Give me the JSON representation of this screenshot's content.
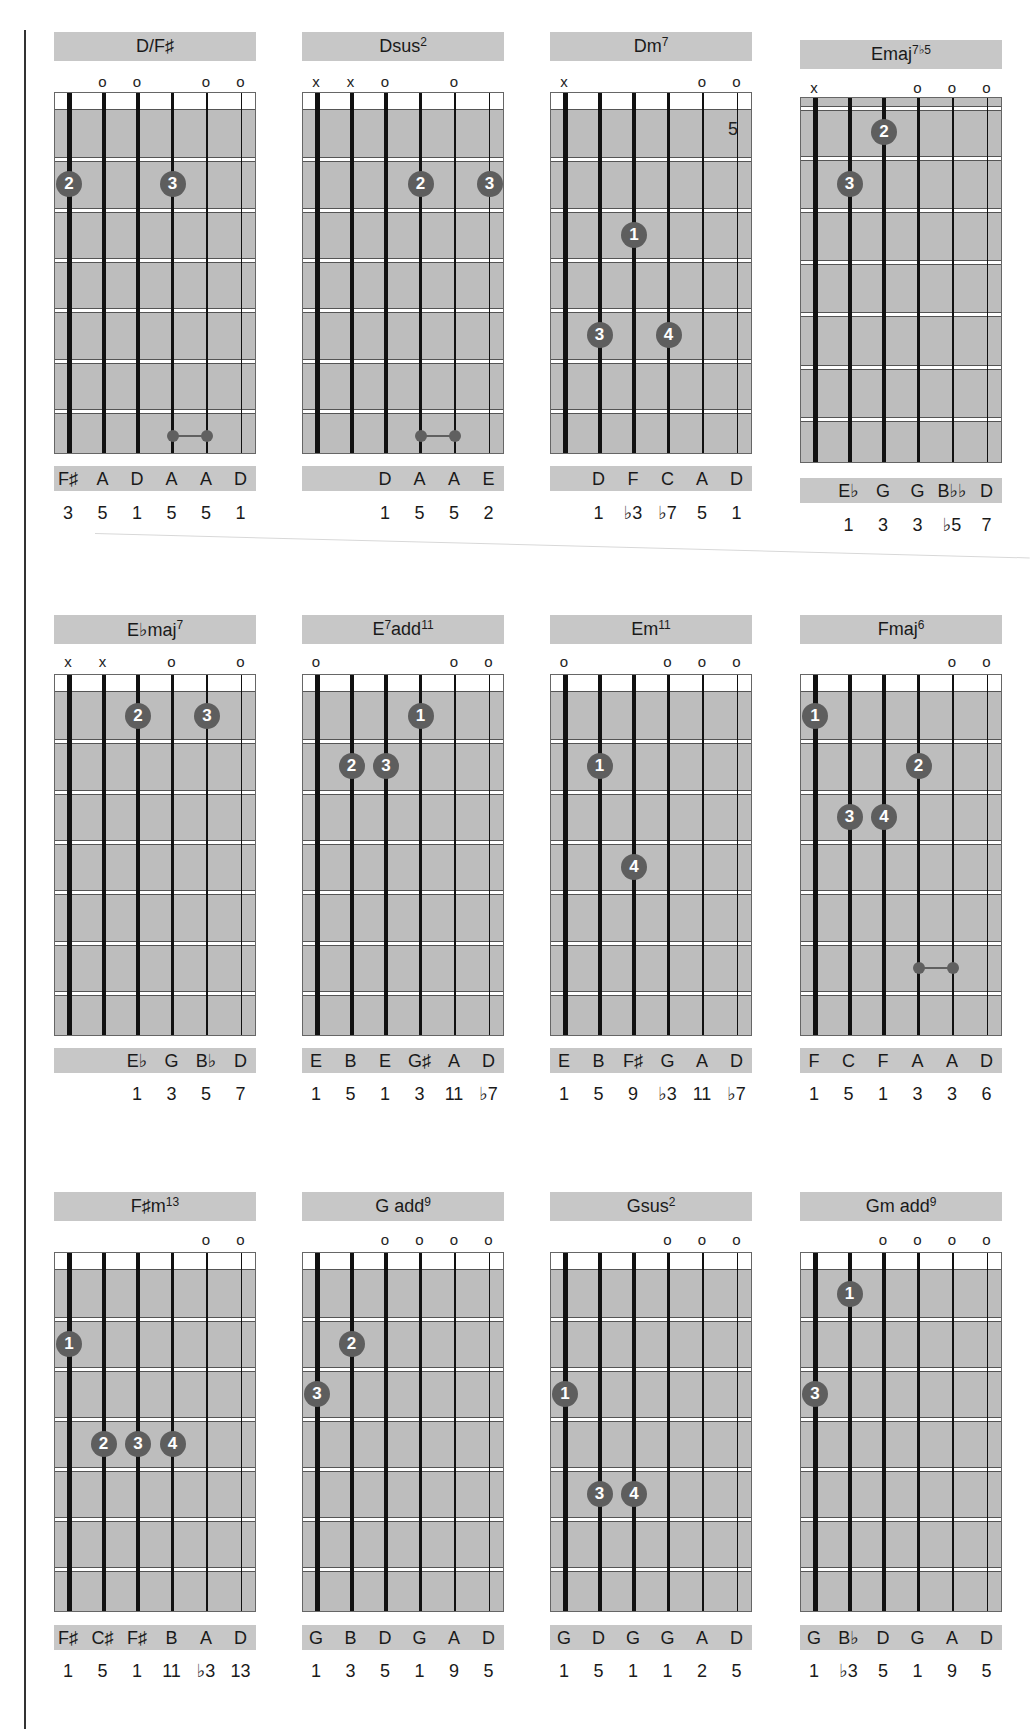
{
  "page": {
    "kind": "guitar chord chart"
  },
  "rows": [
    {
      "chords": [
        {
          "name": "D/F♯",
          "sup": "",
          "markers": [
            "",
            "o",
            "o",
            "",
            "o",
            "o"
          ],
          "position_label": "",
          "fingers": [
            {
              "finger": "2",
              "string": 0,
              "fret": 2
            },
            {
              "finger": "3",
              "string": 3,
              "fret": 2
            }
          ],
          "barre": {
            "from_string": 3,
            "to_string": 4,
            "fret": 7
          },
          "notes": [
            "F♯",
            "A",
            "D",
            "A",
            "A",
            "D"
          ],
          "intervals": [
            "3",
            "5",
            "1",
            "5",
            "5",
            "1"
          ]
        },
        {
          "name": "Dsus",
          "sup": "2",
          "markers": [
            "x",
            "x",
            "o",
            "",
            "o",
            ""
          ],
          "position_label": "",
          "fingers": [
            {
              "finger": "2",
              "string": 3,
              "fret": 2
            },
            {
              "finger": "3",
              "string": 5,
              "fret": 2
            }
          ],
          "barre": {
            "from_string": 3,
            "to_string": 4,
            "fret": 7
          },
          "notes": [
            "",
            "",
            "D",
            "A",
            "A",
            "E"
          ],
          "intervals": [
            "",
            "",
            "1",
            "5",
            "5",
            "2"
          ]
        },
        {
          "name": "Dm",
          "sup": "7",
          "markers": [
            "x",
            "",
            "",
            "",
            "o",
            "o"
          ],
          "position_label": "",
          "fingers": [
            {
              "finger": "1",
              "string": 2,
              "fret": 3
            },
            {
              "finger": "3",
              "string": 1,
              "fret": 5
            },
            {
              "finger": "4",
              "string": 3,
              "fret": 5
            }
          ],
          "barre": null,
          "notes": [
            "",
            "D",
            "F",
            "C",
            "A",
            "D"
          ],
          "intervals": [
            "",
            "1",
            "♭3",
            "♭7",
            "5",
            "1"
          ]
        },
        {
          "name": "Emaj",
          "sup": "7♭5",
          "markers": [
            "x",
            "",
            "",
            "o",
            "o",
            "o"
          ],
          "position_label": "5",
          "fingers": [
            {
              "finger": "2",
              "string": 2,
              "fret": 1
            },
            {
              "finger": "3",
              "string": 1,
              "fret": 2
            }
          ],
          "barre": null,
          "notes": [
            "",
            "E♭",
            "G",
            "G",
            "B♭♭",
            "D"
          ],
          "intervals": [
            "",
            "1",
            "3",
            "3",
            "♭5",
            "7"
          ]
        }
      ]
    },
    {
      "chords": [
        {
          "name": "E♭maj",
          "sup": "7",
          "markers": [
            "x",
            "x",
            "",
            "o",
            "",
            "o"
          ],
          "position_label": "",
          "fingers": [
            {
              "finger": "2",
              "string": 2,
              "fret": 1
            },
            {
              "finger": "3",
              "string": 4,
              "fret": 1
            }
          ],
          "barre": null,
          "notes": [
            "",
            "",
            "E♭",
            "G",
            "B♭",
            "D"
          ],
          "intervals": [
            "",
            "",
            "1",
            "3",
            "5",
            "7"
          ]
        },
        {
          "name": "E",
          "sup": "7",
          "suffix": "add",
          "sup2": "11",
          "markers": [
            "o",
            "",
            "",
            "",
            "o",
            "o"
          ],
          "position_label": "",
          "fingers": [
            {
              "finger": "1",
              "string": 3,
              "fret": 1
            },
            {
              "finger": "2",
              "string": 1,
              "fret": 2
            },
            {
              "finger": "3",
              "string": 2,
              "fret": 2
            }
          ],
          "barre": null,
          "notes": [
            "E",
            "B",
            "E",
            "G♯",
            "A",
            "D"
          ],
          "intervals": [
            "1",
            "5",
            "1",
            "3",
            "11",
            "♭7"
          ]
        },
        {
          "name": "Em",
          "sup": "11",
          "markers": [
            "o",
            "",
            "",
            "o",
            "o",
            "o"
          ],
          "position_label": "",
          "fingers": [
            {
              "finger": "1",
              "string": 1,
              "fret": 2
            },
            {
              "finger": "4",
              "string": 2,
              "fret": 4
            }
          ],
          "barre": null,
          "notes": [
            "E",
            "B",
            "F♯",
            "G",
            "A",
            "D"
          ],
          "intervals": [
            "1",
            "5",
            "9",
            "♭3",
            "11",
            "♭7"
          ]
        },
        {
          "name": "Fmaj",
          "sup": "6",
          "markers": [
            "",
            "",
            "",
            "",
            "o",
            "o"
          ],
          "position_label": "",
          "fingers": [
            {
              "finger": "1",
              "string": 0,
              "fret": 1
            },
            {
              "finger": "2",
              "string": 3,
              "fret": 2
            },
            {
              "finger": "3",
              "string": 1,
              "fret": 3
            },
            {
              "finger": "4",
              "string": 2,
              "fret": 3
            }
          ],
          "barre": {
            "from_string": 3,
            "to_string": 4,
            "fret": 6
          },
          "notes": [
            "F",
            "C",
            "F",
            "A",
            "A",
            "D"
          ],
          "intervals": [
            "1",
            "5",
            "1",
            "3",
            "3",
            "6"
          ]
        }
      ]
    },
    {
      "chords": [
        {
          "name": "F♯m",
          "sup": "13",
          "markers": [
            "",
            "",
            "",
            "",
            "o",
            "o"
          ],
          "position_label": "",
          "fingers": [
            {
              "finger": "1",
              "string": 0,
              "fret": 2
            },
            {
              "finger": "2",
              "string": 1,
              "fret": 4
            },
            {
              "finger": "3",
              "string": 2,
              "fret": 4
            },
            {
              "finger": "4",
              "string": 3,
              "fret": 4
            }
          ],
          "barre": null,
          "notes": [
            "F♯",
            "C♯",
            "F♯",
            "B",
            "A",
            "D"
          ],
          "intervals": [
            "1",
            "5",
            "1",
            "11",
            "♭3",
            "13"
          ]
        },
        {
          "name": "G add",
          "sup": "9",
          "markers": [
            "",
            "",
            "o",
            "o",
            "o",
            "o"
          ],
          "position_label": "",
          "fingers": [
            {
              "finger": "2",
              "string": 1,
              "fret": 2
            },
            {
              "finger": "3",
              "string": 0,
              "fret": 3
            }
          ],
          "barre": null,
          "notes": [
            "G",
            "B",
            "D",
            "G",
            "A",
            "D"
          ],
          "intervals": [
            "1",
            "3",
            "5",
            "1",
            "9",
            "5"
          ]
        },
        {
          "name": "Gsus",
          "sup": "2",
          "markers": [
            "",
            "",
            "",
            "o",
            "o",
            "o"
          ],
          "position_label": "",
          "fingers": [
            {
              "finger": "1",
              "string": 0,
              "fret": 3
            },
            {
              "finger": "3",
              "string": 1,
              "fret": 5
            },
            {
              "finger": "4",
              "string": 2,
              "fret": 5
            }
          ],
          "barre": null,
          "notes": [
            "G",
            "D",
            "G",
            "G",
            "A",
            "D"
          ],
          "intervals": [
            "1",
            "5",
            "1",
            "1",
            "2",
            "5"
          ]
        },
        {
          "name": "Gm add",
          "sup": "9",
          "markers": [
            "",
            "",
            "o",
            "o",
            "o",
            "o"
          ],
          "position_label": "",
          "fingers": [
            {
              "finger": "1",
              "string": 1,
              "fret": 1
            },
            {
              "finger": "3",
              "string": 0,
              "fret": 3
            }
          ],
          "barre": null,
          "notes": [
            "G",
            "B♭",
            "D",
            "G",
            "A",
            "D"
          ],
          "intervals": [
            "1",
            "♭3",
            "5",
            "1",
            "9",
            "5"
          ]
        }
      ]
    }
  ],
  "colors": {
    "panel_gray": "#c7c7c7",
    "fretboard_gray": "#bdbdbd",
    "finger_dot": "#5e5e5e",
    "string": "#111111"
  }
}
